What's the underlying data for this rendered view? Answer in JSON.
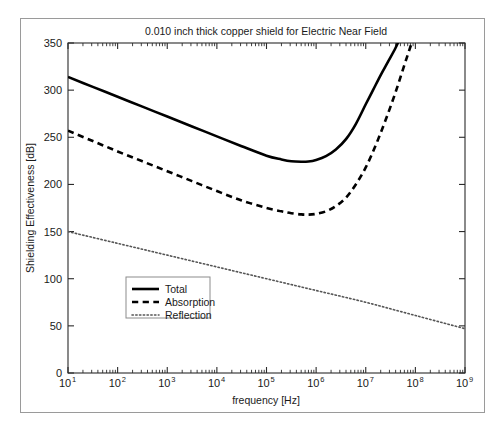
{
  "figure": {
    "title": "0.010 inch thick copper shield for Electric Near Field",
    "background": "#ffffff",
    "frame_color": "#9a9a9a",
    "axis_color": "#2b2b2b"
  },
  "chart_data": {
    "type": "line",
    "title": "0.010 inch thick copper shield for Electric Near Field",
    "xlabel": "frequency [Hz]",
    "ylabel": "Shielding Effectiveness [dB]",
    "xscale": "log",
    "yscale": "linear",
    "xlim": [
      10,
      1000000000
    ],
    "ylim": [
      0,
      350
    ],
    "xticks": [
      "10^1",
      "10^2",
      "10^3",
      "10^4",
      "10^5",
      "10^6",
      "10^7",
      "10^8",
      "10^9"
    ],
    "xtick_mantissa": [
      "10",
      "10",
      "10",
      "10",
      "10",
      "10",
      "10",
      "10",
      "10"
    ],
    "xtick_exponents": [
      "1",
      "2",
      "3",
      "4",
      "5",
      "6",
      "7",
      "8",
      "9"
    ],
    "yticks": [
      0,
      50,
      100,
      150,
      200,
      250,
      300,
      350
    ],
    "grid": false,
    "legend_position": "center-left",
    "series": [
      {
        "name": "Total",
        "style": "solid",
        "color": "#000000",
        "width": 2.6,
        "x": [
          10,
          31.6,
          100,
          316,
          1000,
          3160,
          10000,
          31600,
          100000,
          200000,
          316000,
          500000,
          700000,
          1000000,
          1580000,
          2500000,
          4000000,
          6300000,
          10000000,
          14000000,
          20000000,
          28000000,
          40000000,
          56000000,
          80000000
        ],
        "y": [
          314,
          303.5,
          293,
          282.5,
          272,
          261.5,
          251,
          240.5,
          230.5,
          226.5,
          224.5,
          224,
          224.3,
          226,
          230,
          237,
          248,
          264,
          285,
          300,
          316,
          330,
          345,
          362,
          380
        ]
      },
      {
        "name": "Absorption",
        "style": "dashed",
        "color": "#000000",
        "width": 2.6,
        "x": [
          10,
          31.6,
          100,
          316,
          1000,
          3160,
          10000,
          31600,
          100000,
          200000,
          316000,
          500000,
          700000,
          1000000,
          1580000,
          2500000,
          4000000,
          6300000,
          10000000,
          16000000,
          25000000,
          40000000,
          63000000,
          100000000,
          160000000
        ],
        "y": [
          257,
          246,
          235,
          224.5,
          214,
          203.5,
          193,
          183,
          175,
          171.5,
          169.5,
          168.2,
          168,
          168.8,
          171.5,
          177,
          186,
          200,
          218,
          242,
          268,
          298,
          330,
          362,
          395
        ]
      },
      {
        "name": "Reflection",
        "style": "dotted",
        "color": "#555555",
        "width": 1.6,
        "x": [
          10,
          100,
          1000,
          10000,
          100000,
          1000000,
          10000000,
          100000000,
          1000000000
        ],
        "y": [
          150,
          137.5,
          125,
          112.5,
          100,
          87.5,
          75,
          61,
          47
        ]
      }
    ]
  },
  "legend": {
    "items": [
      {
        "label": "Total",
        "style": "solid"
      },
      {
        "label": "Absorption",
        "style": "dashed"
      },
      {
        "label": "Reflection",
        "style": "dotted"
      }
    ]
  }
}
